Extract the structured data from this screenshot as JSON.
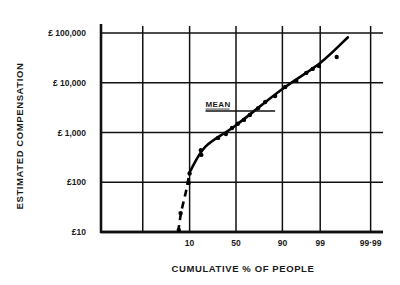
{
  "chart_data": {
    "type": "scatter",
    "title": "",
    "xlabel": "CUMULATIVE % OF PEOPLE",
    "ylabel": "ESTIMATED COMPENSATION",
    "x_scale": "probability",
    "y_scale": "log",
    "xlim": [
      0.01,
      99.99
    ],
    "ylim": [
      10,
      100000
    ],
    "grid": true,
    "x_gridlines": [
      0.5,
      10,
      50,
      90,
      99,
      99.99
    ],
    "x_ticks": [
      {
        "value": 10,
        "label": "10"
      },
      {
        "value": 50,
        "label": "50"
      },
      {
        "value": 90,
        "label": "90"
      },
      {
        "value": 99,
        "label": "99"
      },
      {
        "value": 99.99,
        "label": "99·99"
      }
    ],
    "y_ticks": [
      {
        "value": 10,
        "label": "£10"
      },
      {
        "value": 100,
        "label": "£100"
      },
      {
        "value": 1000,
        "label": "£ 1,000"
      },
      {
        "value": 10000,
        "label": "£ 10,000"
      },
      {
        "value": 100000,
        "label": "£ 100,000"
      }
    ],
    "series": [
      {
        "name": "observed",
        "kind": "points",
        "points": [
          [
            5.7,
            11
          ],
          [
            6.3,
            24
          ],
          [
            9.5,
            97
          ],
          [
            10,
            150
          ],
          [
            16.6,
            440
          ],
          [
            16.9,
            355
          ],
          [
            31,
            780
          ],
          [
            39,
            930
          ],
          [
            45.6,
            1230
          ],
          [
            52,
            1500
          ],
          [
            58.7,
            1790
          ],
          [
            65,
            2250
          ],
          [
            73,
            3100
          ],
          [
            79,
            4100
          ],
          [
            86,
            5400
          ],
          [
            91.3,
            8200
          ],
          [
            95.2,
            10900
          ],
          [
            97.4,
            15800
          ],
          [
            98.3,
            19000
          ],
          [
            98.9,
            21800
          ],
          [
            99.73,
            33000
          ]
        ]
      },
      {
        "name": "fitted-line",
        "kind": "line",
        "points": [
          [
            10,
            160
          ],
          [
            20,
            520
          ],
          [
            50,
            1400
          ],
          [
            90,
            7500
          ],
          [
            99,
            25000
          ],
          [
            99.9,
            82000
          ]
        ]
      },
      {
        "name": "lower-tail",
        "kind": "dashed",
        "points": [
          [
            5.5,
            10
          ],
          [
            6.5,
            25
          ],
          [
            8.5,
            70
          ],
          [
            10,
            160
          ]
        ]
      }
    ],
    "annotations": [
      {
        "text": "MEAN",
        "value": 2700,
        "x_range": [
          20,
          86
        ]
      }
    ],
    "legend": "none"
  }
}
